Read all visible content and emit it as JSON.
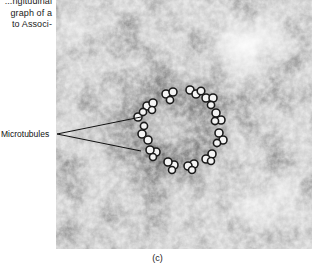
{
  "caption_fragment": {
    "lines": [
      "...ngitudinal",
      "graph of a",
      "to Associ-"
    ]
  },
  "figure": {
    "type": "electron-micrograph",
    "annotation_label": "Microtubules",
    "panel_label": "(c)"
  }
}
